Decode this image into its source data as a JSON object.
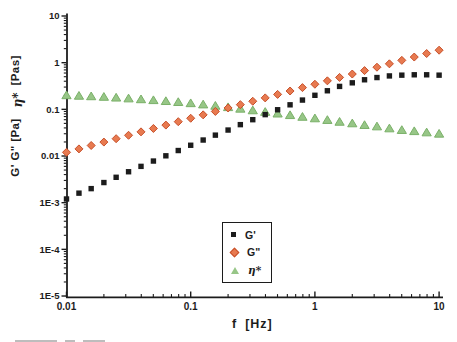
{
  "figure": {
    "background": "#ffffff",
    "axis_color": "#1c1c1c"
  },
  "axes": {
    "x": {
      "scale": "log",
      "min": 0.01,
      "max": 10,
      "title": "f",
      "title_unit": "[Hz]",
      "ticks": [
        {
          "v": 0.01,
          "label": "0.01"
        },
        {
          "v": 0.1,
          "label": "0.1"
        },
        {
          "v": 1,
          "label": "1"
        },
        {
          "v": 10,
          "label": "10"
        }
      ]
    },
    "y": {
      "scale": "log",
      "min": 1e-05,
      "max": 10,
      "title_main": "G' G\"  [Pa]",
      "title_eta": "η*",
      "title_unit": "[Pas]",
      "ticks": [
        {
          "v": 10,
          "label": "10"
        },
        {
          "v": 1,
          "label": "1"
        },
        {
          "v": 0.1,
          "label": "0.1"
        },
        {
          "v": 0.01,
          "label": "0.01"
        },
        {
          "v": 0.001,
          "label": "1E-3"
        },
        {
          "v": 0.0001,
          "label": "1E-4"
        },
        {
          "v": 1e-05,
          "label": "1E-5"
        }
      ]
    }
  },
  "legend": {
    "items": [
      {
        "id": "g-prime",
        "label": "G'",
        "marker": "square",
        "color": "#1c1c1c"
      },
      {
        "id": "g-double-prime",
        "label": "G\"",
        "marker": "diamond",
        "color": "#e87a50"
      },
      {
        "id": "eta-star",
        "label": "η*",
        "marker": "triangle",
        "color": "#97c687"
      }
    ]
  },
  "chart_data": {
    "type": "scatter",
    "title": "",
    "xlabel": "f [Hz]",
    "ylabel": "G' G\" [Pa]  η* [Pas]",
    "x_scale": "log",
    "y_scale": "log",
    "xlim": [
      0.01,
      10
    ],
    "ylim": [
      1e-05,
      10
    ],
    "grid": false,
    "legend_position": "inside-bottom-center",
    "x": [
      0.01,
      0.0126,
      0.0158,
      0.02,
      0.0251,
      0.0316,
      0.0398,
      0.0501,
      0.0631,
      0.0794,
      0.1,
      0.126,
      0.158,
      0.2,
      0.251,
      0.316,
      0.398,
      0.501,
      0.631,
      0.794,
      1,
      1.26,
      1.58,
      2,
      2.51,
      3.16,
      3.98,
      5.01,
      6.31,
      7.94,
      10
    ],
    "series": [
      {
        "id": "g-prime",
        "name": "G'",
        "unit": "Pa",
        "marker": "square",
        "color": "#1c1c1c",
        "edge": "#1c1c1c",
        "values": [
          0.0012,
          0.0016,
          0.002,
          0.0027,
          0.0035,
          0.0046,
          0.006,
          0.0078,
          0.0101,
          0.0131,
          0.017,
          0.022,
          0.028,
          0.036,
          0.047,
          0.06,
          0.077,
          0.098,
          0.125,
          0.158,
          0.2,
          0.25,
          0.31,
          0.37,
          0.43,
          0.48,
          0.52,
          0.54,
          0.55,
          0.55,
          0.54
        ]
      },
      {
        "id": "g-double-prime",
        "name": "G\"",
        "unit": "Pa",
        "marker": "diamond",
        "color": "#e87a50",
        "edge": "#c7502a",
        "values": [
          0.012,
          0.0142,
          0.0168,
          0.0199,
          0.0235,
          0.0278,
          0.0329,
          0.0389,
          0.046,
          0.0544,
          0.0644,
          0.0762,
          0.0901,
          0.107,
          0.126,
          0.149,
          0.176,
          0.209,
          0.247,
          0.292,
          0.345,
          0.408,
          0.483,
          0.571,
          0.676,
          0.799,
          0.945,
          1.12,
          1.32,
          1.57,
          1.85
        ]
      },
      {
        "id": "eta-star",
        "name": "η*",
        "unit": "Pas",
        "marker": "triangle",
        "color": "#97c687",
        "edge": "#7ab068",
        "values": [
          0.2,
          0.195,
          0.19,
          0.185,
          0.178,
          0.171,
          0.164,
          0.157,
          0.15,
          0.143,
          0.135,
          0.127,
          0.119,
          0.111,
          0.103,
          0.095,
          0.088,
          0.081,
          0.075,
          0.069,
          0.064,
          0.059,
          0.054,
          0.05,
          0.046,
          0.043,
          0.039,
          0.036,
          0.034,
          0.032,
          0.03
        ]
      }
    ]
  }
}
